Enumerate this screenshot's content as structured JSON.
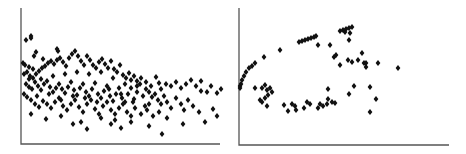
{
  "chart_data": [
    {
      "type": "scatter",
      "title": "",
      "xlabel": "",
      "ylabel": "",
      "grid": false,
      "legend": null,
      "marker": "diamond",
      "marker_color": "#111111",
      "axis_color": "#555555",
      "frame": {
        "x0": 21,
        "y0": 144,
        "x1": 220,
        "y1": 8
      },
      "note": "Unlabeled axes; points given in pixel units relative to axis origin (x right, y up).",
      "points": [
        [
          5,
          104
        ],
        [
          10,
          108
        ],
        [
          10,
          106
        ],
        [
          15,
          92
        ],
        [
          36,
          95
        ],
        [
          37,
          93
        ],
        [
          22,
          85
        ],
        [
          13,
          88
        ],
        [
          2,
          81
        ],
        [
          4,
          79
        ],
        [
          8,
          77
        ],
        [
          12,
          75
        ],
        [
          3,
          70
        ],
        [
          6,
          72
        ],
        [
          9,
          68
        ],
        [
          12,
          66
        ],
        [
          15,
          70
        ],
        [
          18,
          73
        ],
        [
          21,
          76
        ],
        [
          24,
          78
        ],
        [
          27,
          81
        ],
        [
          30,
          83
        ],
        [
          33,
          80
        ],
        [
          36,
          84
        ],
        [
          39,
          86
        ],
        [
          42,
          82
        ],
        [
          45,
          78
        ],
        [
          48,
          86
        ],
        [
          51,
          90
        ],
        [
          54,
          93
        ],
        [
          57,
          88
        ],
        [
          60,
          83
        ],
        [
          63,
          79
        ],
        [
          66,
          88
        ],
        [
          69,
          84
        ],
        [
          72,
          79
        ],
        [
          75,
          76
        ],
        [
          78,
          82
        ],
        [
          81,
          85
        ],
        [
          84,
          80
        ],
        [
          87,
          76
        ],
        [
          90,
          83
        ],
        [
          93,
          75
        ],
        [
          96,
          72
        ],
        [
          99,
          79
        ],
        [
          102,
          69
        ],
        [
          105,
          66
        ],
        [
          108,
          71
        ],
        [
          110,
          64
        ],
        [
          113,
          68
        ],
        [
          116,
          63
        ],
        [
          120,
          66
        ],
        [
          125,
          62
        ],
        [
          130,
          58
        ],
        [
          135,
          67
        ],
        [
          138,
          61
        ],
        [
          140,
          55
        ],
        [
          145,
          60
        ],
        [
          150,
          58
        ],
        [
          155,
          62
        ],
        [
          160,
          56
        ],
        [
          165,
          60
        ],
        [
          170,
          64
        ],
        [
          175,
          58
        ],
        [
          180,
          53
        ],
        [
          186,
          52
        ],
        [
          190,
          58
        ],
        [
          196,
          51
        ],
        [
          200,
          55
        ],
        [
          180,
          63
        ],
        [
          5,
          60
        ],
        [
          8,
          57
        ],
        [
          11,
          55
        ],
        [
          14,
          62
        ],
        [
          17,
          58
        ],
        [
          20,
          54
        ],
        [
          23,
          60
        ],
        [
          26,
          63
        ],
        [
          29,
          57
        ],
        [
          32,
          52
        ],
        [
          35,
          56
        ],
        [
          38,
          60
        ],
        [
          41,
          55
        ],
        [
          44,
          51
        ],
        [
          47,
          57
        ],
        [
          50,
          62
        ],
        [
          53,
          54
        ],
        [
          56,
          49
        ],
        [
          59,
          56
        ],
        [
          62,
          60
        ],
        [
          65,
          52
        ],
        [
          68,
          48
        ],
        [
          71,
          55
        ],
        [
          74,
          61
        ],
        [
          77,
          50
        ],
        [
          80,
          46
        ],
        [
          83,
          53
        ],
        [
          86,
          58
        ],
        [
          89,
          48
        ],
        [
          92,
          43
        ],
        [
          95,
          50
        ],
        [
          98,
          56
        ],
        [
          101,
          46
        ],
        [
          104,
          42
        ],
        [
          107,
          50
        ],
        [
          110,
          56
        ],
        [
          113,
          45
        ],
        [
          116,
          52
        ],
        [
          119,
          60
        ],
        [
          122,
          48
        ],
        [
          125,
          55
        ],
        [
          128,
          40
        ],
        [
          131,
          47
        ],
        [
          134,
          50
        ],
        [
          137,
          44
        ],
        [
          140,
          40
        ],
        [
          143,
          48
        ],
        [
          146,
          42
        ],
        [
          150,
          36
        ],
        [
          155,
          46
        ],
        [
          160,
          40
        ],
        [
          163,
          34
        ],
        [
          167,
          44
        ],
        [
          172,
          38
        ],
        [
          178,
          32
        ],
        [
          3,
          50
        ],
        [
          6,
          47
        ],
        [
          10,
          44
        ],
        [
          14,
          40
        ],
        [
          18,
          37
        ],
        [
          22,
          43
        ],
        [
          26,
          40
        ],
        [
          30,
          36
        ],
        [
          34,
          42
        ],
        [
          38,
          46
        ],
        [
          42,
          38
        ],
        [
          46,
          34
        ],
        [
          50,
          40
        ],
        [
          54,
          44
        ],
        [
          58,
          37
        ],
        [
          62,
          32
        ],
        [
          66,
          40
        ],
        [
          70,
          44
        ],
        [
          74,
          35
        ],
        [
          78,
          30
        ],
        [
          82,
          38
        ],
        [
          86,
          42
        ],
        [
          90,
          34
        ],
        [
          94,
          30
        ],
        [
          98,
          36
        ],
        [
          102,
          40
        ],
        [
          106,
          32
        ],
        [
          110,
          28
        ],
        [
          114,
          36
        ],
        [
          120,
          30
        ],
        [
          126,
          34
        ],
        [
          132,
          28
        ],
        [
          138,
          32
        ],
        [
          146,
          26
        ],
        [
          10,
          30
        ],
        [
          25,
          25
        ],
        [
          40,
          28
        ],
        [
          52,
          20
        ],
        [
          60,
          22
        ],
        [
          66,
          15
        ],
        [
          80,
          26
        ],
        [
          90,
          20
        ],
        [
          94,
          24
        ],
        [
          100,
          16
        ],
        [
          110,
          22
        ],
        [
          128,
          18
        ],
        [
          141,
          10
        ],
        [
          162,
          20
        ],
        [
          184,
          22
        ],
        [
          192,
          35
        ],
        [
          196,
          28
        ],
        [
          8,
          65
        ],
        [
          20,
          65
        ],
        [
          32,
          68
        ],
        [
          44,
          70
        ],
        [
          56,
          72
        ],
        [
          68,
          70
        ],
        [
          80,
          72
        ],
        [
          92,
          66
        ],
        [
          104,
          60
        ],
        [
          116,
          58
        ],
        [
          128,
          52
        ],
        [
          16,
          48
        ],
        [
          28,
          50
        ],
        [
          40,
          44
        ],
        [
          52,
          48
        ],
        [
          64,
          46
        ],
        [
          76,
          42
        ],
        [
          88,
          55
        ],
        [
          100,
          50
        ],
        [
          112,
          42
        ],
        [
          124,
          38
        ]
      ]
    },
    {
      "type": "scatter",
      "title": "",
      "xlabel": "",
      "ylabel": "",
      "grid": false,
      "legend": null,
      "marker": "diamond",
      "marker_color": "#111111",
      "axis_color": "#555555",
      "frame": {
        "x0": 239,
        "y0": 145,
        "x1": 449,
        "y1": 8
      },
      "note": "Unlabeled axes; points given in pixel units relative to axis origin (x right, y up).",
      "points": [
        [
          1,
          57
        ],
        [
          1,
          59
        ],
        [
          2,
          61
        ],
        [
          3,
          65
        ],
        [
          5,
          69
        ],
        [
          7,
          73
        ],
        [
          10,
          77
        ],
        [
          13,
          79
        ],
        [
          16,
          82
        ],
        [
          25,
          88
        ],
        [
          41,
          95
        ],
        [
          60,
          103
        ],
        [
          63,
          104
        ],
        [
          66,
          105
        ],
        [
          69,
          106
        ],
        [
          72,
          107
        ],
        [
          75,
          108
        ],
        [
          77,
          109
        ],
        [
          101,
          114
        ],
        [
          104,
          115
        ],
        [
          107,
          116
        ],
        [
          110,
          117
        ],
        [
          113,
          118
        ],
        [
          106,
          113
        ],
        [
          111,
          112
        ],
        [
          110,
          105
        ],
        [
          79,
          100
        ],
        [
          91,
          100
        ],
        [
          95,
          88
        ],
        [
          97,
          90
        ],
        [
          101,
          80
        ],
        [
          109,
          85
        ],
        [
          113,
          83
        ],
        [
          119,
          85
        ],
        [
          123,
          92
        ],
        [
          125,
          82
        ],
        [
          127,
          78
        ],
        [
          127,
          82
        ],
        [
          139,
          82
        ],
        [
          159,
          77
        ],
        [
          16,
          57
        ],
        [
          23,
          57
        ],
        [
          26,
          60
        ],
        [
          28,
          55
        ],
        [
          31,
          57
        ],
        [
          21,
          45
        ],
        [
          23,
          43
        ],
        [
          26,
          47
        ],
        [
          29,
          50
        ],
        [
          33,
          53
        ],
        [
          28,
          39
        ],
        [
          45,
          40
        ],
        [
          49,
          34
        ],
        [
          53,
          41
        ],
        [
          56,
          39
        ],
        [
          57,
          35
        ],
        [
          65,
          37
        ],
        [
          68,
          43
        ],
        [
          71,
          41
        ],
        [
          79,
          37
        ],
        [
          81,
          41
        ],
        [
          84,
          39
        ],
        [
          88,
          41
        ],
        [
          89,
          46
        ],
        [
          93,
          43
        ],
        [
          96,
          42
        ],
        [
          89,
          56
        ],
        [
          110,
          51
        ],
        [
          115,
          59
        ],
        [
          131,
          58
        ],
        [
          137,
          46
        ],
        [
          131,
          33
        ]
      ]
    }
  ]
}
